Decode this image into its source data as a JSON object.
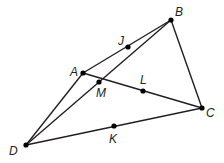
{
  "diagram": {
    "type": "geometry",
    "points": {
      "A": {
        "label": "A",
        "x": 83,
        "y": 73,
        "lx": 70,
        "ly": 76
      },
      "B": {
        "label": "B",
        "x": 171,
        "y": 20,
        "lx": 175,
        "ly": 16
      },
      "C": {
        "label": "C",
        "x": 202,
        "y": 108,
        "lx": 206,
        "ly": 117
      },
      "D": {
        "label": "D",
        "x": 26,
        "y": 145,
        "lx": 9,
        "ly": 155
      },
      "J": {
        "label": "J",
        "x": 128,
        "y": 47,
        "lx": 118,
        "ly": 45
      },
      "K": {
        "label": "K",
        "x": 114,
        "y": 126,
        "lx": 109,
        "ly": 143
      },
      "L": {
        "label": "L",
        "x": 143,
        "y": 91,
        "lx": 140,
        "ly": 84
      },
      "M": {
        "label": "M",
        "x": 99,
        "y": 82,
        "lx": 96,
        "ly": 97
      }
    },
    "segments": [
      [
        "A",
        "B"
      ],
      [
        "A",
        "C"
      ],
      [
        "B",
        "C"
      ],
      [
        "C",
        "D"
      ],
      [
        "D",
        "A"
      ],
      [
        "D",
        "B"
      ]
    ],
    "colors": {
      "stroke": "#231f20",
      "point": "#000000"
    }
  }
}
